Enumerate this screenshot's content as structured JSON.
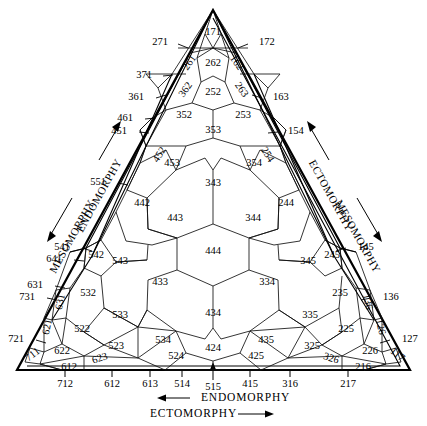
{
  "chart_data": {
    "type": "diagram",
    "axis_titles": {
      "left_outer": "MESOMORPHY",
      "left_inner": "ENDOMORPHY",
      "right_outer": "ECTOMORPHY",
      "right_inner": "MESOMORPHY",
      "bottom_upper": "ENDOMORPHY",
      "bottom_lower": "ECTOMORPHY"
    },
    "arrows": {
      "left_outer_dir": "down",
      "left_inner_dir": "up",
      "right_outer_dir": "up",
      "right_inner_dir": "down",
      "bottom_upper_dir": "left",
      "bottom_lower_dir": "right"
    },
    "interior_cells": [
      {
        "id": "171",
        "x": 213,
        "y": 33
      },
      {
        "id": "262",
        "x": 213,
        "y": 64
      },
      {
        "id": "261",
        "x": 190,
        "y": 63,
        "rot": -55
      },
      {
        "id": "162",
        "x": 236,
        "y": 63,
        "rot": 55
      },
      {
        "id": "252",
        "x": 213,
        "y": 93
      },
      {
        "id": "362",
        "x": 186,
        "y": 90,
        "rot": -55
      },
      {
        "id": "263",
        "x": 241,
        "y": 90,
        "rot": 55
      },
      {
        "id": "352",
        "x": 184,
        "y": 116
      },
      {
        "id": "253",
        "x": 243,
        "y": 116
      },
      {
        "id": "353",
        "x": 213,
        "y": 131
      },
      {
        "id": "452",
        "x": 160,
        "y": 155,
        "rot": -58
      },
      {
        "id": "254",
        "x": 267,
        "y": 155,
        "rot": 58
      },
      {
        "id": "453",
        "x": 172,
        "y": 164
      },
      {
        "id": "354",
        "x": 254,
        "y": 164
      },
      {
        "id": "343",
        "x": 213,
        "y": 184
      },
      {
        "id": "442",
        "x": 142,
        "y": 204
      },
      {
        "id": "244",
        "x": 286,
        "y": 204
      },
      {
        "id": "443",
        "x": 175,
        "y": 219
      },
      {
        "id": "344",
        "x": 253,
        "y": 219
      },
      {
        "id": "444",
        "x": 213,
        "y": 252
      },
      {
        "id": "433",
        "x": 160,
        "y": 283
      },
      {
        "id": "334",
        "x": 267,
        "y": 283
      },
      {
        "id": "543",
        "x": 120,
        "y": 262
      },
      {
        "id": "345",
        "x": 308,
        "y": 262
      },
      {
        "id": "542",
        "x": 96,
        "y": 256
      },
      {
        "id": "245",
        "x": 332,
        "y": 256
      },
      {
        "id": "532",
        "x": 88,
        "y": 294
      },
      {
        "id": "235",
        "x": 340,
        "y": 294
      },
      {
        "id": "533",
        "x": 120,
        "y": 316
      },
      {
        "id": "335",
        "x": 310,
        "y": 316
      },
      {
        "id": "434",
        "x": 213,
        "y": 314
      },
      {
        "id": "522",
        "x": 82,
        "y": 330
      },
      {
        "id": "225",
        "x": 346,
        "y": 330
      },
      {
        "id": "523",
        "x": 116,
        "y": 347
      },
      {
        "id": "325",
        "x": 312,
        "y": 347
      },
      {
        "id": "534",
        "x": 163,
        "y": 341
      },
      {
        "id": "435",
        "x": 266,
        "y": 341
      },
      {
        "id": "524",
        "x": 176,
        "y": 357
      },
      {
        "id": "425",
        "x": 256,
        "y": 357
      },
      {
        "id": "424",
        "x": 213,
        "y": 349
      },
      {
        "id": "622",
        "x": 62,
        "y": 352
      },
      {
        "id": "226",
        "x": 370,
        "y": 352
      },
      {
        "id": "623",
        "x": 100,
        "y": 359,
        "rot": -18
      },
      {
        "id": "326",
        "x": 331,
        "y": 359,
        "rot": 18
      },
      {
        "id": "612",
        "x": 69,
        "y": 368
      },
      {
        "id": "216",
        "x": 363,
        "y": 368
      },
      {
        "id": "711",
        "x": 33,
        "y": 355,
        "rot": -38
      },
      {
        "id": "117",
        "x": 397,
        "y": 355,
        "rot": 38
      },
      {
        "id": "631",
        "x": 61,
        "y": 302,
        "rot": -78
      },
      {
        "id": "136",
        "x": 367,
        "y": 302,
        "rot": 78
      },
      {
        "id": "621",
        "x": 48,
        "y": 327,
        "rot": -78
      },
      {
        "id": "126",
        "x": 380,
        "y": 327,
        "rot": 78
      }
    ],
    "left_edge_labels": [
      {
        "id": "271",
        "x": 168,
        "y": 43
      },
      {
        "id": "371",
        "x": 152,
        "y": 76
      },
      {
        "id": "361",
        "x": 144,
        "y": 98
      },
      {
        "id": "461",
        "x": 133,
        "y": 119
      },
      {
        "id": "451",
        "x": 127,
        "y": 132
      },
      {
        "id": "551",
        "x": 106,
        "y": 183
      },
      {
        "id": "541",
        "x": 70,
        "y": 248
      },
      {
        "id": "641",
        "x": 62,
        "y": 260
      },
      {
        "id": "631",
        "x": 43,
        "y": 286
      },
      {
        "id": "731",
        "x": 35,
        "y": 298
      },
      {
        "id": "721",
        "x": 24,
        "y": 340
      }
    ],
    "right_edge_labels": [
      {
        "id": "172",
        "x": 259,
        "y": 43
      },
      {
        "id": "163",
        "x": 273,
        "y": 98
      },
      {
        "id": "154",
        "x": 288,
        "y": 132
      },
      {
        "id": "145",
        "x": 358,
        "y": 248
      },
      {
        "id": "136",
        "x": 383,
        "y": 298
      },
      {
        "id": "127",
        "x": 402,
        "y": 340
      }
    ],
    "bottom_axis_labels": [
      {
        "id": "712",
        "x": 65,
        "y": 385
      },
      {
        "id": "612",
        "x": 112,
        "y": 385
      },
      {
        "id": "613",
        "x": 150,
        "y": 385
      },
      {
        "id": "514",
        "x": 182,
        "y": 385
      },
      {
        "id": "515",
        "x": 213,
        "y": 388
      },
      {
        "id": "415",
        "x": 250,
        "y": 385
      },
      {
        "id": "316",
        "x": 290,
        "y": 385
      },
      {
        "id": "217",
        "x": 348,
        "y": 385
      }
    ]
  }
}
